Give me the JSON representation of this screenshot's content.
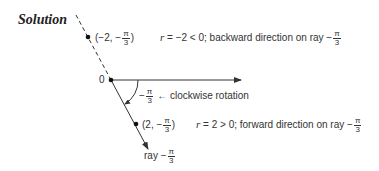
{
  "title": "Solution",
  "origin_label": "0",
  "point_neg": {
    "label_prefix": "(−2, −",
    "frac_num": "π",
    "frac_den": "3",
    "label_suffix": ")"
  },
  "point_neg_note": {
    "r": "r",
    "text": " = −2 < 0; backward direction on ray −",
    "frac_num": "π",
    "frac_den": "3"
  },
  "angle_label": {
    "prefix": "−",
    "frac_num": "π",
    "frac_den": "3",
    "arrow": "←",
    "text": " clockwise rotation"
  },
  "point_pos": {
    "label_prefix": "(2, −",
    "frac_num": "π",
    "frac_den": "3",
    "label_suffix": ")"
  },
  "point_pos_note": {
    "r": "r",
    "text": " = 2 > 0; forward direction on ray −",
    "frac_num": "π",
    "frac_den": "3"
  },
  "ray_label": {
    "prefix": "ray −",
    "frac_num": "π",
    "frac_den": "3"
  },
  "colors": {
    "ink": "#333333",
    "background": "#ffffff"
  }
}
